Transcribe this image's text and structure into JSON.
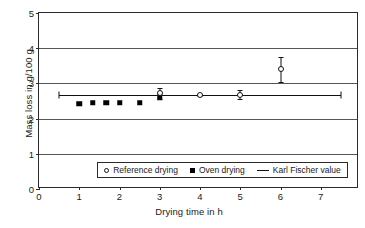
{
  "chart_data": {
    "type": "scatter",
    "title": "",
    "xlabel": "Drying time in h",
    "ylabel": "Mass loss in g/100 g",
    "xlim": [
      0,
      7.95
    ],
    "ylim": [
      0,
      5
    ],
    "xticks": [
      "0",
      "1",
      "2",
      "3",
      "4",
      "5",
      "6",
      "7"
    ],
    "xtick_values": [
      0,
      1,
      2,
      3,
      4,
      5,
      6,
      7
    ],
    "yticks": [
      "0",
      "1",
      "2",
      "3",
      "4",
      "5"
    ],
    "ytick_values": [
      0,
      1,
      2,
      3,
      4,
      5
    ],
    "grid": "horizontal",
    "legend_position": "lower center",
    "series": [
      {
        "name": "Reference drying",
        "marker": "open-circle",
        "x": [
          3.0,
          4.0,
          5.0,
          6.0
        ],
        "y": [
          2.72,
          2.68,
          2.68,
          3.4
        ],
        "yerr": [
          0.16,
          0.03,
          0.13,
          0.35
        ]
      },
      {
        "name": "Oven drying",
        "marker": "filled-square",
        "x": [
          1.0,
          1.33,
          1.67,
          2.0,
          2.5,
          3.0
        ],
        "y": [
          2.42,
          2.45,
          2.45,
          2.45,
          2.45,
          2.6
        ],
        "yerr": [
          0,
          0,
          0,
          0,
          0,
          0
        ]
      },
      {
        "name": "Karl Fischer value",
        "marker": "line",
        "x": [
          0.5,
          7.5
        ],
        "y": [
          2.68,
          2.68
        ],
        "yerr": [
          0,
          0
        ]
      }
    ]
  },
  "legend": {
    "entries": [
      {
        "label": "Reference drying",
        "marker": "open-circle"
      },
      {
        "label": "Oven drying",
        "marker": "filled-square"
      },
      {
        "label": "Karl Fischer value",
        "marker": "line"
      }
    ]
  },
  "colors": {
    "axis": "#2a2a2a",
    "grid": "#555555",
    "marker": "#000000",
    "background": "#ffffff"
  }
}
